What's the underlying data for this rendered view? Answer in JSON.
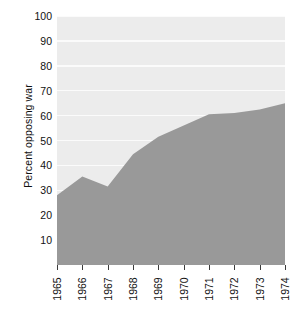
{
  "figure": {
    "background_color": "#ffffff",
    "panel_color": "#ececec",
    "gridline_color": "#fbfbfb",
    "area_color": "#999999",
    "caption_fragment": ""
  },
  "chart_data": {
    "type": "area",
    "title": "",
    "xlabel": "",
    "ylabel": "Percent opposing war",
    "x": [
      1965,
      1966,
      1967,
      1968,
      1969,
      1970,
      1971,
      1972,
      1973,
      1974
    ],
    "categories": [
      "1965",
      "1966",
      "1967",
      "1968",
      "1969",
      "1970",
      "1971",
      "1972",
      "1973",
      "1974"
    ],
    "values": [
      28,
      35.5,
      31.5,
      44.5,
      51.5,
      56,
      60.5,
      61,
      62.5,
      65
    ],
    "series": [
      {
        "name": "Percent opposing war",
        "values": [
          28,
          35.5,
          31.5,
          44.5,
          51.5,
          56,
          60.5,
          61,
          62.5,
          65
        ]
      }
    ],
    "ylim": [
      0,
      100
    ],
    "ytick_values": [
      10,
      20,
      30,
      40,
      50,
      60,
      70,
      80,
      90,
      100
    ],
    "ytick_labels": [
      "10",
      "20",
      "30",
      "40",
      "50",
      "60",
      "70",
      "80",
      "90",
      "100"
    ],
    "xtick_labels": [
      "1965",
      "1966",
      "1967",
      "1968",
      "1969",
      "1970",
      "1971",
      "1972",
      "1973",
      "1974"
    ],
    "grid": "horizontal-only",
    "legend": "none",
    "fill_color": "#999999"
  }
}
